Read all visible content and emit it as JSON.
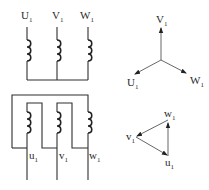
{
  "diagram": {
    "star_connection": {
      "terminals": [
        {
          "name": "U",
          "sub": "1"
        },
        {
          "name": "V",
          "sub": "1"
        },
        {
          "name": "W",
          "sub": "1"
        }
      ]
    },
    "delta_connection": {
      "terminals": [
        {
          "name": "u",
          "sub": "1"
        },
        {
          "name": "v",
          "sub": "1"
        },
        {
          "name": "w",
          "sub": "1"
        }
      ]
    },
    "star_phasor": {
      "vectors": [
        {
          "name": "V",
          "sub": "1"
        },
        {
          "name": "U",
          "sub": "1"
        },
        {
          "name": "W",
          "sub": "1"
        }
      ]
    },
    "delta_phasor": {
      "vertices": [
        {
          "name": "w",
          "sub": "1"
        },
        {
          "name": "v",
          "sub": "1"
        },
        {
          "name": "u",
          "sub": "1"
        }
      ]
    },
    "colors": {
      "line": "#2e2e2e",
      "background": "#ffffff"
    }
  }
}
